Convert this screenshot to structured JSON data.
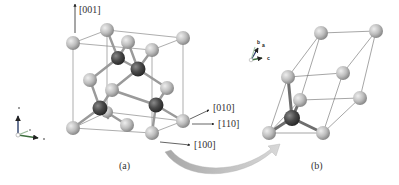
{
  "panels": [
    {
      "id": "a",
      "caption": "(a)",
      "description": "Conventional cubic cell (diamond structure)",
      "direction_labels": {
        "z": "[001]",
        "y": "[010]",
        "xy": "[110]",
        "x": "[100]"
      }
    },
    {
      "id": "b",
      "caption": "(b)",
      "description": "Primitive rhombohedral cell",
      "axis_labels": {
        "a": "a",
        "b": "b",
        "c": "c"
      }
    }
  ],
  "colors": {
    "light_atom": "#b8b8b8",
    "dark_atom": "#4a4a4a",
    "cell_edge": "#8a8a8a",
    "bond_light": "#c8c8c8",
    "arrow_fill": "#c4c4c4",
    "text": "#333333",
    "axis_green": "#3c6e3c",
    "axis_blue": "#2c3e6a"
  }
}
